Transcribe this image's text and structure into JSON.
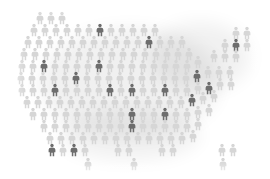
{
  "graphic": {
    "title": "United States pictogram map",
    "subject": "us-map",
    "icon_name": "person-icon",
    "description": "Map of the contiguous United States rendered as a grid of human figure icons, with a scattered subset highlighted in dark gray."
  },
  "colors": {
    "background": "#ffffff",
    "figure_light": "#d6d6d6",
    "figure_mid": "#c2c2c2",
    "figure_dark": "#6d6d6d",
    "figure_darker": "#5a5a5a",
    "shadow": "#000000"
  },
  "chart_data": {
    "type": "pictogram",
    "xlabel": "",
    "ylabel": "",
    "unit_label": "person-icon",
    "categories": [
      "unhighlighted",
      "highlighted"
    ],
    "values": [
      150,
      22
    ],
    "legend": [
      {
        "label": "unhighlighted",
        "color": "#d6d6d6"
      },
      {
        "label": "highlighted",
        "color": "#6d6d6d"
      }
    ],
    "grid": false,
    "legend_position": "none",
    "icon_grid": {
      "columns": 22,
      "rows": 14,
      "col_pitch": 11.2,
      "row_pitch": 11.6,
      "origin_x": 22,
      "origin_y": 18
    },
    "figures": [
      {
        "x": 40,
        "y": 18,
        "tone": "light"
      },
      {
        "x": 51,
        "y": 18,
        "tone": "light"
      },
      {
        "x": 62,
        "y": 18,
        "tone": "light"
      },
      {
        "x": 34,
        "y": 30,
        "tone": "light"
      },
      {
        "x": 45,
        "y": 30,
        "tone": "light"
      },
      {
        "x": 56,
        "y": 30,
        "tone": "light"
      },
      {
        "x": 67,
        "y": 30,
        "tone": "light"
      },
      {
        "x": 78,
        "y": 30,
        "tone": "light"
      },
      {
        "x": 89,
        "y": 30,
        "tone": "light"
      },
      {
        "x": 100,
        "y": 30,
        "tone": "dark"
      },
      {
        "x": 111,
        "y": 30,
        "tone": "light"
      },
      {
        "x": 122,
        "y": 30,
        "tone": "light"
      },
      {
        "x": 133,
        "y": 30,
        "tone": "light"
      },
      {
        "x": 144,
        "y": 30,
        "tone": "light"
      },
      {
        "x": 155,
        "y": 30,
        "tone": "light"
      },
      {
        "x": 28,
        "y": 42,
        "tone": "light"
      },
      {
        "x": 39,
        "y": 42,
        "tone": "light"
      },
      {
        "x": 50,
        "y": 42,
        "tone": "light"
      },
      {
        "x": 61,
        "y": 42,
        "tone": "light"
      },
      {
        "x": 72,
        "y": 42,
        "tone": "light"
      },
      {
        "x": 83,
        "y": 42,
        "tone": "light"
      },
      {
        "x": 94,
        "y": 42,
        "tone": "light"
      },
      {
        "x": 105,
        "y": 42,
        "tone": "light"
      },
      {
        "x": 116,
        "y": 42,
        "tone": "light"
      },
      {
        "x": 127,
        "y": 42,
        "tone": "light"
      },
      {
        "x": 138,
        "y": 42,
        "tone": "light"
      },
      {
        "x": 149,
        "y": 42,
        "tone": "dark"
      },
      {
        "x": 160,
        "y": 42,
        "tone": "light"
      },
      {
        "x": 171,
        "y": 42,
        "tone": "light"
      },
      {
        "x": 182,
        "y": 42,
        "tone": "light"
      },
      {
        "x": 236,
        "y": 33,
        "tone": "light"
      },
      {
        "x": 247,
        "y": 33,
        "tone": "light"
      },
      {
        "x": 24,
        "y": 54,
        "tone": "light"
      },
      {
        "x": 35,
        "y": 54,
        "tone": "light"
      },
      {
        "x": 46,
        "y": 54,
        "tone": "light"
      },
      {
        "x": 57,
        "y": 54,
        "tone": "light"
      },
      {
        "x": 68,
        "y": 54,
        "tone": "light"
      },
      {
        "x": 79,
        "y": 54,
        "tone": "light"
      },
      {
        "x": 90,
        "y": 54,
        "tone": "light"
      },
      {
        "x": 101,
        "y": 54,
        "tone": "light"
      },
      {
        "x": 112,
        "y": 54,
        "tone": "light"
      },
      {
        "x": 123,
        "y": 54,
        "tone": "light"
      },
      {
        "x": 134,
        "y": 54,
        "tone": "light"
      },
      {
        "x": 145,
        "y": 54,
        "tone": "light"
      },
      {
        "x": 156,
        "y": 54,
        "tone": "light"
      },
      {
        "x": 167,
        "y": 54,
        "tone": "light"
      },
      {
        "x": 178,
        "y": 54,
        "tone": "light"
      },
      {
        "x": 189,
        "y": 54,
        "tone": "light"
      },
      {
        "x": 225,
        "y": 45,
        "tone": "light"
      },
      {
        "x": 236,
        "y": 45,
        "tone": "dark"
      },
      {
        "x": 247,
        "y": 45,
        "tone": "light"
      },
      {
        "x": 22,
        "y": 66,
        "tone": "light"
      },
      {
        "x": 33,
        "y": 66,
        "tone": "light"
      },
      {
        "x": 44,
        "y": 66,
        "tone": "dark"
      },
      {
        "x": 55,
        "y": 66,
        "tone": "light"
      },
      {
        "x": 66,
        "y": 66,
        "tone": "light"
      },
      {
        "x": 77,
        "y": 66,
        "tone": "light"
      },
      {
        "x": 88,
        "y": 66,
        "tone": "light"
      },
      {
        "x": 99,
        "y": 66,
        "tone": "dark"
      },
      {
        "x": 110,
        "y": 66,
        "tone": "light"
      },
      {
        "x": 121,
        "y": 66,
        "tone": "light"
      },
      {
        "x": 132,
        "y": 66,
        "tone": "light"
      },
      {
        "x": 143,
        "y": 66,
        "tone": "light"
      },
      {
        "x": 154,
        "y": 66,
        "tone": "light"
      },
      {
        "x": 165,
        "y": 66,
        "tone": "light"
      },
      {
        "x": 176,
        "y": 66,
        "tone": "light"
      },
      {
        "x": 187,
        "y": 66,
        "tone": "light"
      },
      {
        "x": 198,
        "y": 62,
        "tone": "light"
      },
      {
        "x": 214,
        "y": 56,
        "tone": "light"
      },
      {
        "x": 225,
        "y": 56,
        "tone": "light"
      },
      {
        "x": 236,
        "y": 56,
        "tone": "light"
      },
      {
        "x": 21,
        "y": 78,
        "tone": "light"
      },
      {
        "x": 32,
        "y": 78,
        "tone": "light"
      },
      {
        "x": 43,
        "y": 78,
        "tone": "light"
      },
      {
        "x": 54,
        "y": 78,
        "tone": "light"
      },
      {
        "x": 65,
        "y": 78,
        "tone": "light"
      },
      {
        "x": 76,
        "y": 78,
        "tone": "dark"
      },
      {
        "x": 87,
        "y": 78,
        "tone": "light"
      },
      {
        "x": 98,
        "y": 78,
        "tone": "light"
      },
      {
        "x": 109,
        "y": 78,
        "tone": "light"
      },
      {
        "x": 120,
        "y": 78,
        "tone": "light"
      },
      {
        "x": 131,
        "y": 78,
        "tone": "light"
      },
      {
        "x": 142,
        "y": 78,
        "tone": "light"
      },
      {
        "x": 153,
        "y": 78,
        "tone": "light"
      },
      {
        "x": 164,
        "y": 78,
        "tone": "light"
      },
      {
        "x": 175,
        "y": 78,
        "tone": "light"
      },
      {
        "x": 186,
        "y": 78,
        "tone": "light"
      },
      {
        "x": 197,
        "y": 76,
        "tone": "dark"
      },
      {
        "x": 208,
        "y": 72,
        "tone": "light"
      },
      {
        "x": 219,
        "y": 72,
        "tone": "light"
      },
      {
        "x": 230,
        "y": 72,
        "tone": "light"
      },
      {
        "x": 22,
        "y": 90,
        "tone": "light"
      },
      {
        "x": 33,
        "y": 90,
        "tone": "light"
      },
      {
        "x": 44,
        "y": 90,
        "tone": "light"
      },
      {
        "x": 55,
        "y": 90,
        "tone": "dark"
      },
      {
        "x": 66,
        "y": 90,
        "tone": "light"
      },
      {
        "x": 77,
        "y": 90,
        "tone": "light"
      },
      {
        "x": 88,
        "y": 90,
        "tone": "light"
      },
      {
        "x": 99,
        "y": 90,
        "tone": "light"
      },
      {
        "x": 110,
        "y": 90,
        "tone": "dark"
      },
      {
        "x": 121,
        "y": 90,
        "tone": "light"
      },
      {
        "x": 132,
        "y": 90,
        "tone": "dark"
      },
      {
        "x": 143,
        "y": 90,
        "tone": "light"
      },
      {
        "x": 154,
        "y": 90,
        "tone": "light"
      },
      {
        "x": 165,
        "y": 90,
        "tone": "dark"
      },
      {
        "x": 176,
        "y": 90,
        "tone": "light"
      },
      {
        "x": 187,
        "y": 90,
        "tone": "light"
      },
      {
        "x": 198,
        "y": 88,
        "tone": "light"
      },
      {
        "x": 209,
        "y": 88,
        "tone": "dark"
      },
      {
        "x": 220,
        "y": 84,
        "tone": "light"
      },
      {
        "x": 231,
        "y": 84,
        "tone": "light"
      },
      {
        "x": 27,
        "y": 102,
        "tone": "light"
      },
      {
        "x": 38,
        "y": 102,
        "tone": "light"
      },
      {
        "x": 49,
        "y": 102,
        "tone": "light"
      },
      {
        "x": 60,
        "y": 102,
        "tone": "light"
      },
      {
        "x": 71,
        "y": 102,
        "tone": "light"
      },
      {
        "x": 82,
        "y": 102,
        "tone": "light"
      },
      {
        "x": 93,
        "y": 102,
        "tone": "light"
      },
      {
        "x": 104,
        "y": 102,
        "tone": "light"
      },
      {
        "x": 115,
        "y": 102,
        "tone": "light"
      },
      {
        "x": 126,
        "y": 102,
        "tone": "light"
      },
      {
        "x": 137,
        "y": 102,
        "tone": "light"
      },
      {
        "x": 148,
        "y": 102,
        "tone": "light"
      },
      {
        "x": 159,
        "y": 102,
        "tone": "light"
      },
      {
        "x": 170,
        "y": 102,
        "tone": "light"
      },
      {
        "x": 181,
        "y": 102,
        "tone": "light"
      },
      {
        "x": 192,
        "y": 100,
        "tone": "dark"
      },
      {
        "x": 203,
        "y": 98,
        "tone": "light"
      },
      {
        "x": 214,
        "y": 96,
        "tone": "light"
      },
      {
        "x": 33,
        "y": 114,
        "tone": "light"
      },
      {
        "x": 44,
        "y": 114,
        "tone": "light"
      },
      {
        "x": 55,
        "y": 114,
        "tone": "light"
      },
      {
        "x": 66,
        "y": 114,
        "tone": "light"
      },
      {
        "x": 77,
        "y": 114,
        "tone": "light"
      },
      {
        "x": 88,
        "y": 114,
        "tone": "light"
      },
      {
        "x": 99,
        "y": 114,
        "tone": "light"
      },
      {
        "x": 110,
        "y": 114,
        "tone": "light"
      },
      {
        "x": 121,
        "y": 114,
        "tone": "light"
      },
      {
        "x": 132,
        "y": 114,
        "tone": "dark"
      },
      {
        "x": 143,
        "y": 114,
        "tone": "light"
      },
      {
        "x": 154,
        "y": 114,
        "tone": "light"
      },
      {
        "x": 165,
        "y": 114,
        "tone": "dark"
      },
      {
        "x": 176,
        "y": 114,
        "tone": "light"
      },
      {
        "x": 187,
        "y": 114,
        "tone": "light"
      },
      {
        "x": 198,
        "y": 112,
        "tone": "light"
      },
      {
        "x": 209,
        "y": 110,
        "tone": "light"
      },
      {
        "x": 44,
        "y": 126,
        "tone": "light"
      },
      {
        "x": 55,
        "y": 126,
        "tone": "light"
      },
      {
        "x": 66,
        "y": 126,
        "tone": "light"
      },
      {
        "x": 77,
        "y": 126,
        "tone": "light"
      },
      {
        "x": 88,
        "y": 126,
        "tone": "light"
      },
      {
        "x": 99,
        "y": 126,
        "tone": "light"
      },
      {
        "x": 110,
        "y": 126,
        "tone": "light"
      },
      {
        "x": 121,
        "y": 126,
        "tone": "light"
      },
      {
        "x": 132,
        "y": 126,
        "tone": "dark"
      },
      {
        "x": 143,
        "y": 126,
        "tone": "light"
      },
      {
        "x": 154,
        "y": 126,
        "tone": "light"
      },
      {
        "x": 165,
        "y": 126,
        "tone": "light"
      },
      {
        "x": 176,
        "y": 126,
        "tone": "light"
      },
      {
        "x": 187,
        "y": 126,
        "tone": "light"
      },
      {
        "x": 198,
        "y": 124,
        "tone": "light"
      },
      {
        "x": 50,
        "y": 138,
        "tone": "light"
      },
      {
        "x": 61,
        "y": 138,
        "tone": "light"
      },
      {
        "x": 72,
        "y": 138,
        "tone": "light"
      },
      {
        "x": 83,
        "y": 138,
        "tone": "light"
      },
      {
        "x": 94,
        "y": 138,
        "tone": "light"
      },
      {
        "x": 105,
        "y": 138,
        "tone": "light"
      },
      {
        "x": 116,
        "y": 138,
        "tone": "light"
      },
      {
        "x": 127,
        "y": 138,
        "tone": "light"
      },
      {
        "x": 138,
        "y": 138,
        "tone": "light"
      },
      {
        "x": 149,
        "y": 138,
        "tone": "light"
      },
      {
        "x": 160,
        "y": 138,
        "tone": "light"
      },
      {
        "x": 171,
        "y": 138,
        "tone": "light"
      },
      {
        "x": 182,
        "y": 138,
        "tone": "light"
      },
      {
        "x": 193,
        "y": 136,
        "tone": "light"
      },
      {
        "x": 52,
        "y": 150,
        "tone": "dark"
      },
      {
        "x": 63,
        "y": 150,
        "tone": "light"
      },
      {
        "x": 74,
        "y": 150,
        "tone": "dark"
      },
      {
        "x": 85,
        "y": 150,
        "tone": "light"
      },
      {
        "x": 118,
        "y": 150,
        "tone": "light"
      },
      {
        "x": 129,
        "y": 150,
        "tone": "light"
      },
      {
        "x": 162,
        "y": 150,
        "tone": "light"
      },
      {
        "x": 173,
        "y": 150,
        "tone": "light"
      },
      {
        "x": 222,
        "y": 150,
        "tone": "light"
      },
      {
        "x": 233,
        "y": 150,
        "tone": "light"
      },
      {
        "x": 88,
        "y": 164,
        "tone": "light"
      },
      {
        "x": 134,
        "y": 164,
        "tone": "light"
      },
      {
        "x": 223,
        "y": 164,
        "tone": "light"
      }
    ]
  }
}
